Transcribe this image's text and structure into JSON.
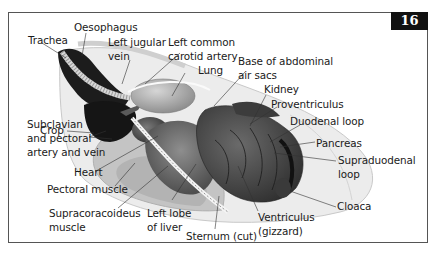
{
  "figure": {
    "number": "16"
  },
  "labels": {
    "trachea": "Trachea",
    "oesophagus": "Oesophagus",
    "left_jugular_vein_1": "Left jugular",
    "left_jugular_vein_2": "vein",
    "left_common_carotid_1": "Left common",
    "left_common_carotid_2": "carotid artery",
    "lung": "Lung",
    "base_abdominal_air_sacs_1": "Base of abdominal",
    "base_abdominal_air_sacs_2": "air sacs",
    "kidney": "Kidney",
    "proventriculus": "Proventriculus",
    "duodenal_loop": "Duodenal loop",
    "pancreas": "Pancreas",
    "supraduodenal_loop_1": "Supraduodenal",
    "supraduodenal_loop_2": "loop",
    "cloaca": "Cloaca",
    "crop": "Crop",
    "subclavian_1": "Subclavian",
    "subclavian_2": "and pectoral",
    "subclavian_3": "artery and vein",
    "heart": "Heart",
    "pectoral_muscle": "Pectoral muscle",
    "supracoracoideus_1": "Supracoracoideus",
    "supracoracoideus_2": "muscle",
    "left_lobe_liver_1": "Left lobe",
    "left_lobe_liver_2": "of liver",
    "sternum": "Sternum (cut)",
    "ventriculus_1": "Ventriculus",
    "ventriculus_2": "(gizzard)"
  },
  "colors": {
    "badge_bg": "#111111",
    "badge_text": "#ffffff",
    "frame": "#555555",
    "label_text": "#1a1a1a",
    "leader_line": "#333333"
  }
}
